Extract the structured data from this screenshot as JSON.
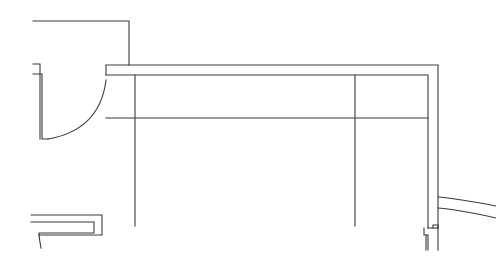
{
  "diagram": {
    "type": "architectural-floor-plan",
    "stroke_color": "#3a3a3a",
    "background": "#ffffff",
    "labels": []
  }
}
